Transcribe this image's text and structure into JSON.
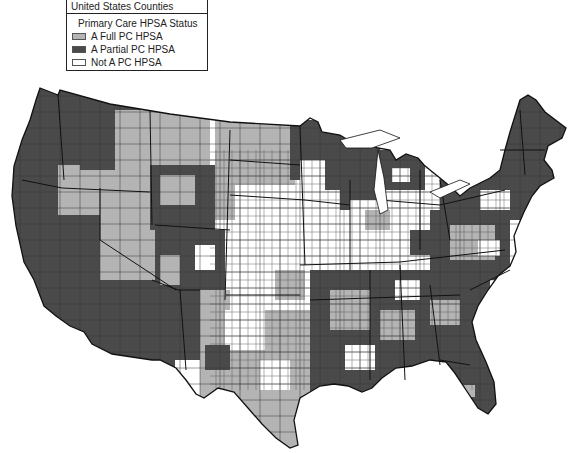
{
  "legend": {
    "title": "United States Counties",
    "subtitle": "Primary Care HPSA Status",
    "items": [
      {
        "label": "A Full PC HPSA",
        "color": "#b4b4b4"
      },
      {
        "label": "A Partial PC HPSA",
        "color": "#4a4a4a"
      },
      {
        "label": "Not A PC HPSA",
        "color": "#ffffff"
      }
    ]
  },
  "map": {
    "region": "Contiguous United States",
    "unit": "Counties",
    "colors": {
      "full": "#b4b4b4",
      "partial": "#4a4a4a",
      "none": "#ffffff",
      "border": "#1a1a1a"
    }
  }
}
